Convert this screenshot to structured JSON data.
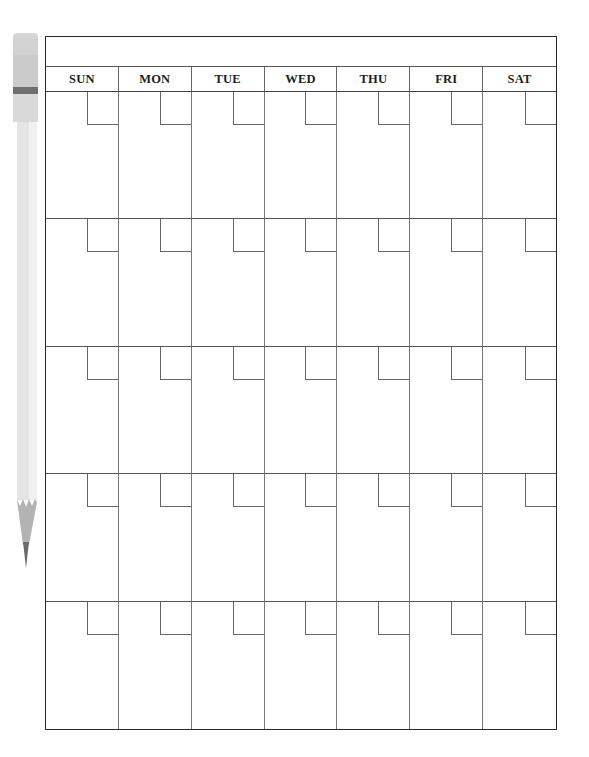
{
  "calendar": {
    "title": "",
    "days": [
      {
        "label": "SUN"
      },
      {
        "label": "MON"
      },
      {
        "label": "TUE"
      },
      {
        "label": "WED"
      },
      {
        "label": "THU"
      },
      {
        "label": "FRI"
      },
      {
        "label": "SAT"
      }
    ],
    "weeks": [
      {
        "dates": [
          "",
          "",
          "",
          "",
          "",
          "",
          ""
        ]
      },
      {
        "dates": [
          "",
          "",
          "",
          "",
          "",
          "",
          ""
        ]
      },
      {
        "dates": [
          "",
          "",
          "",
          "",
          "",
          "",
          ""
        ]
      },
      {
        "dates": [
          "",
          "",
          "",
          "",
          "",
          "",
          ""
        ]
      },
      {
        "dates": [
          "",
          "",
          "",
          "",
          "",
          "",
          ""
        ]
      }
    ]
  },
  "decoration": {
    "icon": "pencil-icon",
    "colors": {
      "eraser": "#d4d4d4",
      "ferrule": "#cfcfcf",
      "band": "#6e6e6e",
      "body": "#e6e6e6",
      "body_highlight": "#f2f2f2",
      "wood": "#b5b5b5",
      "lead": "#6a6a6a"
    }
  },
  "colors": {
    "frame": "#2a2a2a",
    "grid_lines": "#666666",
    "text": "#1e1e1e"
  }
}
